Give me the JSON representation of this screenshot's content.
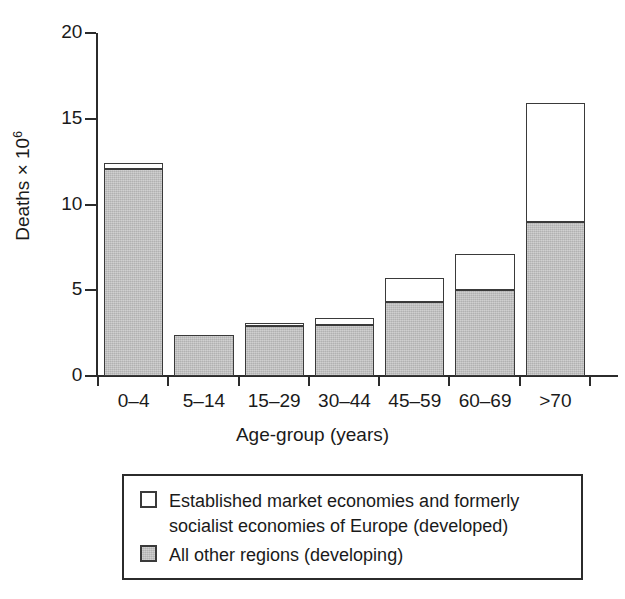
{
  "chart_data": {
    "type": "bar",
    "stacked": true,
    "title": "",
    "xlabel": "Age-group (years)",
    "ylabel": "Deaths × 10",
    "ylabel_exponent": "6",
    "categories": [
      "0–4",
      "5–14",
      "15–29",
      "30–44",
      "45–59",
      "60–69",
      ">70"
    ],
    "series": [
      {
        "name": "All other regions (developing)",
        "color": "#bfbfbf",
        "values": [
          12.1,
          2.4,
          2.9,
          3.0,
          4.3,
          5.0,
          9.0
        ]
      },
      {
        "name": "Established market economies and formerly socialist economies of Europe (developed)",
        "color": "#ffffff",
        "values": [
          0.3,
          0.0,
          0.2,
          0.4,
          1.4,
          2.1,
          6.9
        ]
      }
    ],
    "totals": [
      12.4,
      2.4,
      3.1,
      3.4,
      5.7,
      7.1,
      15.9
    ],
    "ylim": [
      0,
      20
    ],
    "yticks": [
      0,
      5,
      10,
      15,
      20
    ],
    "ytick_labels": [
      "0",
      "5",
      "10",
      "15",
      "20"
    ],
    "grid": false,
    "legend_position": "below"
  },
  "axes": {
    "y_title_text": "Deaths × 10",
    "y_title_sup": "6",
    "x_title_text": "Age-group (years)"
  },
  "legend": {
    "entries": [
      {
        "swatch": "white",
        "label": "Established market economies and formerly\nsocialist economies of Europe (developed)"
      },
      {
        "swatch": "gray",
        "label": "All other regions (developing)"
      }
    ]
  },
  "colors": {
    "developing_fill": "#bfbfbf",
    "developed_fill": "#ffffff",
    "ink": "#2b2b2b",
    "bar_outline": "#3a3a3a"
  }
}
